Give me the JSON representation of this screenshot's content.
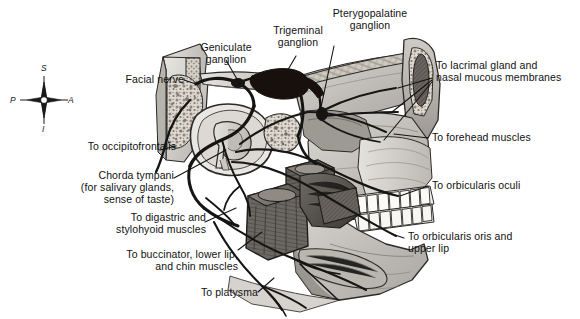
{
  "figure": {
    "kind": "anatomical-illustration",
    "background_color": "#ffffff",
    "ink_color": "#111111",
    "style": "grayscale medical line-and-tone drawing"
  },
  "orientation_compass": {
    "name": "anatomical-orientation-compass",
    "superior": "S",
    "inferior": "I",
    "anterior": "A",
    "posterior": "P"
  },
  "labels": [
    {
      "id": "facial-nerve",
      "text": "Facial nerve",
      "align": "right"
    },
    {
      "id": "geniculate-ganglion",
      "text": "Geniculate\nganglion",
      "align": "center"
    },
    {
      "id": "trigeminal-ganglion",
      "text": "Trigeminal\nganglion",
      "align": "center"
    },
    {
      "id": "pterygopalatine-ganglion",
      "text": "Pterygopalatine\nganglion",
      "align": "center"
    },
    {
      "id": "lacrimal-gland",
      "text": "To lacrimal gland and\nnasal mucous membranes",
      "align": "left"
    },
    {
      "id": "forehead-muscles",
      "text": "To forehead muscles",
      "align": "left"
    },
    {
      "id": "orbicularis-oculi",
      "text": "To orbicularis oculi",
      "align": "left"
    },
    {
      "id": "orbicularis-oris",
      "text": "To orbicularis oris and\nupper lip",
      "align": "left"
    },
    {
      "id": "occipitofrontalis",
      "text": "To occipitofrontalis",
      "align": "right"
    },
    {
      "id": "chorda-tympani",
      "text": "Chorda tympani\n(for salivary glands,\nsense of taste)",
      "align": "right"
    },
    {
      "id": "digastric-stylohyoid",
      "text": "To digastric and\nstylohyoid muscles",
      "align": "right"
    },
    {
      "id": "buccinator",
      "text": "To buccinator, lower lip,\nand chin muscles",
      "align": "right"
    },
    {
      "id": "platysma",
      "text": "To platysma",
      "align": "right"
    }
  ]
}
